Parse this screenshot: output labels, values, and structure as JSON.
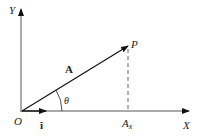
{
  "diagram": {
    "axes": {
      "x_label": "X",
      "y_label": "Y",
      "origin_label": "O"
    },
    "vector": {
      "label": "A",
      "tip_label": "P",
      "angle_label": "θ"
    },
    "unit_vector_label": "î",
    "projection_label": "A",
    "projection_subscript": "x",
    "colors": {
      "stroke": "#222222",
      "axis": "#555555",
      "dashed": "#666666"
    }
  }
}
